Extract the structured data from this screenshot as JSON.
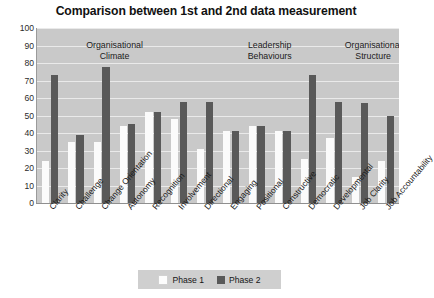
{
  "chart_data": {
    "type": "bar",
    "title": "Comparison between 1st and 2nd data measurement",
    "xlabel": "",
    "ylabel": "",
    "ylim": [
      0,
      100
    ],
    "yticks": [
      0,
      10,
      20,
      30,
      40,
      50,
      60,
      70,
      80,
      90,
      100
    ],
    "grid": true,
    "legend_position": "bottom-center",
    "categories": [
      "Clarity",
      "Challenge",
      "Change Orientation",
      "Autonomy",
      "Recognition",
      "Involvement",
      "Directional",
      "Engaging",
      "Positional",
      "Constructive",
      "Democratic",
      "Developmental",
      "Job Clarity",
      "Job Accountability"
    ],
    "series": [
      {
        "name": "Phase 1",
        "color": "#fbfbfb",
        "values": [
          24,
          35,
          35,
          44,
          52,
          48,
          31,
          41,
          44,
          41,
          25,
          37,
          15,
          24
        ]
      },
      {
        "name": "Phase 2",
        "color": "#595959",
        "values": [
          73,
          39,
          78,
          45,
          52,
          58,
          58,
          41,
          44,
          41,
          73,
          58,
          57,
          50
        ]
      }
    ],
    "annotations": [
      {
        "text": "Organisational\nClimate",
        "category_span": [
          0,
          5
        ]
      },
      {
        "text": "Leadership\nBehaviours",
        "category_span": [
          6,
          11
        ]
      },
      {
        "text": "Organisational\nStructure",
        "category_span": [
          12,
          13
        ]
      }
    ]
  },
  "legend": {
    "items": [
      {
        "label": "Phase 1",
        "color": "#fbfbfb"
      },
      {
        "label": "Phase 2",
        "color": "#595959"
      }
    ]
  },
  "colors": {
    "plot_background": "#c9c9c9",
    "gridline": "#eaeaea",
    "phase1": "#fbfbfb",
    "phase2": "#595959",
    "legend_background": "#cfcfcf",
    "text": "#171717"
  }
}
